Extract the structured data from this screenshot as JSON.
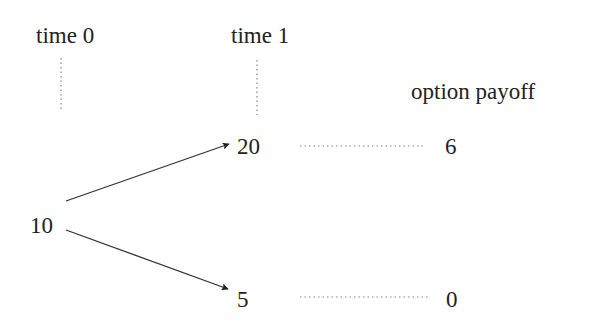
{
  "headers": {
    "time0": "time 0",
    "time1": "time 1",
    "payoff": "option payoff"
  },
  "tree": {
    "root": "10",
    "up_node": "20",
    "down_node": "5",
    "up_payoff": "6",
    "down_payoff": "0"
  },
  "colors": {
    "text": "#222222",
    "line": "#333333",
    "dotted": "#888888"
  }
}
